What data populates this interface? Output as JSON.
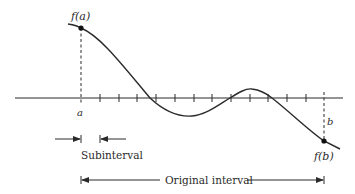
{
  "diagram": {
    "type": "function-interval-subdivision",
    "labels": {
      "f_a": "f(a)",
      "f_b": "f(b)",
      "a": "a",
      "b": "b",
      "subinterval": "Subinterval",
      "original_interval": "Original interval"
    },
    "axis": {
      "x_start": 15,
      "x_end": 343,
      "y": 98
    },
    "ticks": {
      "a_x": 81,
      "b_x": 324,
      "count": 13,
      "positions": [
        81,
        100,
        119,
        137,
        156,
        175,
        194,
        212,
        231,
        250,
        268,
        287,
        306,
        324
      ]
    },
    "curve": {
      "description": "smooth curve starting above axis at f(a), descending to cross the axis, dipping to a minimum, rising to a small maximum above the axis, then descending to f(b) below the axis",
      "points": {
        "start": [
          68,
          24
        ],
        "f_a": [
          81,
          28
        ],
        "cross_down_1": [
          150,
          98
        ],
        "minimum": [
          192,
          116
        ],
        "cross_up": [
          230,
          98
        ],
        "maximum": [
          252,
          89
        ],
        "cross_down_2": [
          272,
          98
        ],
        "f_b": [
          324,
          141
        ],
        "end": [
          340,
          149
        ]
      }
    },
    "colors": {
      "stroke": "#2a2a2a",
      "background": "#ffffff"
    }
  }
}
